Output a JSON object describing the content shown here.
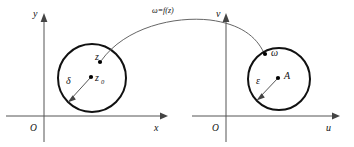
{
  "figure": {
    "background_color": "#ffffff",
    "curve_color": "#666666",
    "circle_color": "#111111",
    "axis_color": "#555555",
    "width": 354,
    "height": 147
  },
  "mapping": {
    "label": "ω=f(z)"
  },
  "z_plane": {
    "origin_label": "O",
    "x_axis_label": "x",
    "y_axis_label": "y",
    "circle": {
      "center_label": "z₀",
      "center_label_base": "z",
      "center_label_sub": "0",
      "radius_label": "δ",
      "point_label": "z"
    }
  },
  "w_plane": {
    "origin_label": "O",
    "x_axis_label": "u",
    "y_axis_label": "v",
    "circle": {
      "center_label": "A",
      "radius_label": "ε",
      "point_label": "ω"
    }
  }
}
